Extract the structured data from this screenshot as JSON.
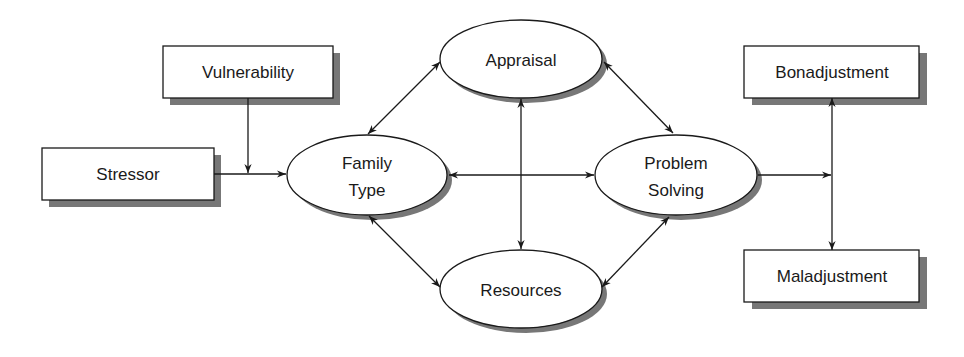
{
  "diagram": {
    "type": "flow-model",
    "nodes": {
      "vulnerability": {
        "label": "Vulnerability",
        "shape": "box"
      },
      "stressor": {
        "label": "Stressor",
        "shape": "box"
      },
      "family_type": {
        "label_line1": "Family",
        "label_line2": "Type",
        "shape": "ellipse"
      },
      "appraisal": {
        "label": "Appraisal",
        "shape": "ellipse"
      },
      "resources": {
        "label": "Resources",
        "shape": "ellipse"
      },
      "problem_solving": {
        "label_line1": "Problem",
        "label_line2": "Solving",
        "shape": "ellipse"
      },
      "bonadjustment": {
        "label": "Bonadjustment",
        "shape": "box"
      },
      "maladjustment": {
        "label": "Maladjustment",
        "shape": "box"
      }
    },
    "edges": [
      {
        "from": "stressor",
        "to": "family_type",
        "direction": "forward"
      },
      {
        "from": "vulnerability",
        "to": "stressor-family_type-link",
        "direction": "forward"
      },
      {
        "from": "family_type",
        "to": "appraisal",
        "direction": "both"
      },
      {
        "from": "family_type",
        "to": "problem_solving",
        "direction": "both"
      },
      {
        "from": "family_type",
        "to": "resources",
        "direction": "both"
      },
      {
        "from": "appraisal",
        "to": "resources",
        "direction": "both"
      },
      {
        "from": "appraisal",
        "to": "problem_solving",
        "direction": "both"
      },
      {
        "from": "resources",
        "to": "problem_solving",
        "direction": "both"
      },
      {
        "from": "problem_solving",
        "to": "outcome-axis",
        "direction": "forward"
      },
      {
        "from": "bonadjustment",
        "to": "maladjustment",
        "direction": "both"
      }
    ],
    "colors": {
      "stroke": "#1a1a1a",
      "shadow": "#777777",
      "fill": "#ffffff"
    }
  }
}
